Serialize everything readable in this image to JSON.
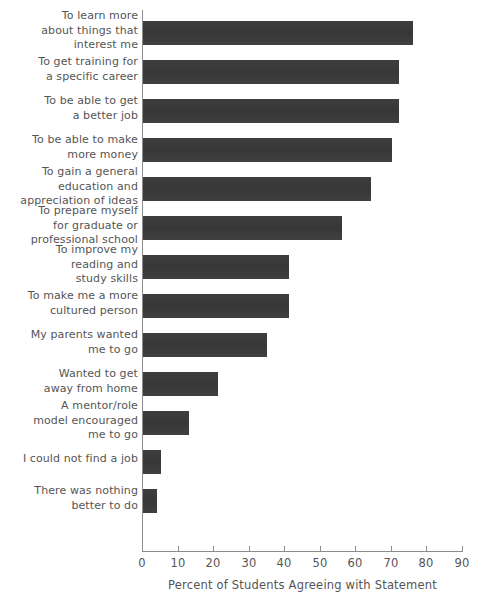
{
  "chart_data": {
    "type": "bar",
    "orientation": "horizontal",
    "title": "",
    "subtitle": "",
    "xlabel": "Percent of Students Agreeing with Statement",
    "ylabel": "",
    "xlim": [
      0,
      90
    ],
    "xticks": [
      0,
      10,
      20,
      30,
      40,
      50,
      60,
      70,
      80,
      90
    ],
    "xtick_labels": [
      "0",
      "10",
      "20",
      "30",
      "40",
      "50",
      "60",
      "70",
      "80",
      "90"
    ],
    "grid": false,
    "legend": false,
    "bar_color": "#3a3a3a",
    "axis_color": "#8d8d8d",
    "text_color": "#555555",
    "categories": [
      "To learn more\nabout things that\ninterest me",
      "To get training for\na specific career",
      "To be able to get\na better job",
      "To be able to make\nmore money",
      "To gain a general\neducation and\nappreciation of ideas",
      "To prepare myself\nfor graduate or\nprofessional school",
      "To improve my\nreading and\nstudy skills",
      "To make me a more\ncultured person",
      "My parents wanted\nme to go",
      "Wanted to get\naway from home",
      "A mentor/role\nmodel encouraged\nme to go",
      "I could not find a job",
      "There was nothing\nbetter to do"
    ],
    "values": [
      76,
      72,
      72,
      70,
      64,
      56,
      41,
      41,
      35,
      21,
      13,
      5,
      4
    ]
  }
}
